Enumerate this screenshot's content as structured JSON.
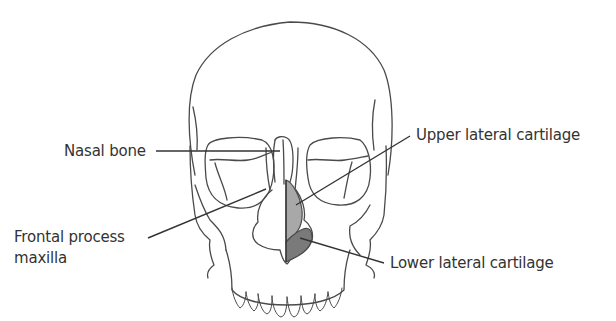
{
  "figure": {
    "labels": {
      "nasal_bone": "Nasal bone",
      "frontal_process_line1": "Frontal process",
      "frontal_process_line2": "maxilla",
      "upper_lateral_cartilage": "Upper lateral cartilage",
      "lower_lateral_cartilage": "Lower lateral cartilage"
    },
    "colors": {
      "outline": "#4a4a4a",
      "leader_line": "#333333",
      "upper_cartilage_fill": "#a8a8a8",
      "lower_cartilage_fill": "#7a7a7a",
      "text": "#333333"
    }
  }
}
